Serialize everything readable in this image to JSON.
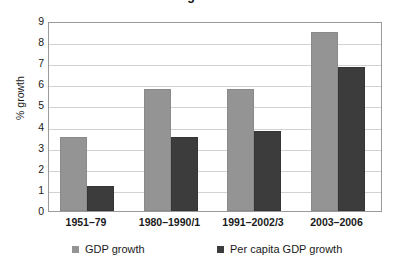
{
  "title_fragment": "Economic growth in India",
  "chart_data": {
    "type": "bar",
    "title": "",
    "xlabel": "",
    "ylabel": "% growth",
    "ylim": [
      0,
      9
    ],
    "ytick_step": 1,
    "grid": true,
    "legend_position": "bottom",
    "categories": [
      "1951–79",
      "1980–1990/1",
      "1991–2002/3",
      "2003–2006"
    ],
    "ytick_labels": [
      "0",
      "1",
      "2",
      "3",
      "4",
      "5",
      "6",
      "7",
      "8",
      "9"
    ],
    "series": [
      {
        "name": "GDP growth",
        "color": "#949494",
        "values": [
          3.5,
          5.8,
          5.8,
          8.5
        ]
      },
      {
        "name": "Per capita GDP growth",
        "color": "#3c3c3c",
        "values": [
          1.2,
          3.5,
          3.8,
          6.8
        ]
      }
    ]
  },
  "axis": {
    "y_title": "% growth"
  },
  "legend": {
    "items": [
      {
        "label": "GDP growth",
        "swatch": "light"
      },
      {
        "label": "Per capita GDP growth",
        "swatch": "dark"
      }
    ]
  },
  "colors": {
    "series_light": "#949494",
    "series_dark": "#3c3c3c",
    "gridline": "#d2d2d2",
    "axis_border": "#9a9a9a",
    "text": "#1a1a1a"
  }
}
